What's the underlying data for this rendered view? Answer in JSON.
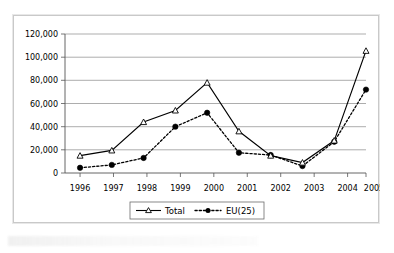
{
  "chart_data": {
    "type": "line",
    "title": "",
    "xlabel": "",
    "ylabel": "",
    "categories": [
      "1996",
      "1997",
      "1998",
      "1999",
      "2000",
      "2001",
      "2002",
      "2003",
      "2004",
      "2005"
    ],
    "series": [
      {
        "name": "Total",
        "marker": "open-triangle",
        "line_style": "solid",
        "color": "#000000",
        "values": [
          15000,
          19500,
          44000,
          54000,
          78000,
          36000,
          15000,
          9000,
          28000,
          105500
        ]
      },
      {
        "name": "EU(25)",
        "marker": "filled-circle",
        "line_style": "dotted",
        "color": "#000000",
        "values": [
          4500,
          7000,
          13000,
          40000,
          52000,
          17500,
          15500,
          6000,
          27000,
          72000
        ]
      }
    ],
    "ylim": [
      0,
      120000
    ],
    "ytick_step": 20000,
    "ytick_labels": [
      "0",
      "20,000",
      "40,000",
      "60,000",
      "80,000",
      "100,000",
      "120,000"
    ],
    "xtick_labels": [
      "1996",
      "1997",
      "1998",
      "1999",
      "2000",
      "2001",
      "2002",
      "2003",
      "2004",
      "2005"
    ],
    "grid": "horizontal",
    "legend_position": "bottom-center",
    "legend_entries": [
      "Total",
      "EU(25)"
    ],
    "plot_background": "#ffffff",
    "gridline_color": "#8a8a8a",
    "axis_color": "#555555"
  },
  "legend": {
    "total_label": "Total",
    "eu_label": "EU(25)"
  },
  "yticks": {
    "t0": "0",
    "t1": "20,000",
    "t2": "40,000",
    "t3": "60,000",
    "t4": "80,000",
    "t5": "100,000",
    "t6": "120,000"
  },
  "xticks": {
    "x0": "1996",
    "x1": "1997",
    "x2": "1998",
    "x3": "1999",
    "x4": "2000",
    "x5": "2001",
    "x6": "2002",
    "x7": "2003",
    "x8": "2004",
    "x9": "2005"
  }
}
